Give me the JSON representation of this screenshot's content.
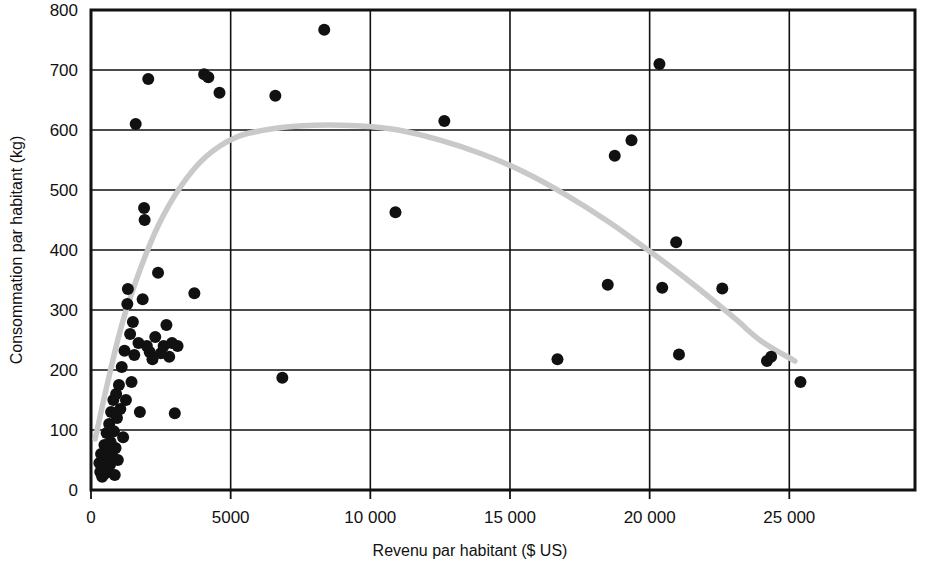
{
  "chart_data": {
    "type": "scatter",
    "title": "",
    "xlabel": "Revenu par habitant ($ US)",
    "ylabel": "Consommation par habitant (kg)",
    "xlim": [
      0,
      29500
    ],
    "ylim": [
      0,
      800
    ],
    "xticks": [
      0,
      5000,
      10000,
      15000,
      20000,
      25000
    ],
    "xtick_labels": [
      "0",
      "5000",
      "10 000",
      "15 000",
      "20 000",
      "25 000"
    ],
    "yticks": [
      0,
      100,
      200,
      300,
      400,
      500,
      600,
      700,
      800
    ],
    "ytick_labels": [
      "0",
      "100",
      "200",
      "300",
      "400",
      "500",
      "600",
      "700",
      "800"
    ],
    "grid": true,
    "grid_axis": "both",
    "legend": false,
    "marker_color": "#111111",
    "marker_size": 12,
    "trendline": {
      "label": "quadratic fit",
      "color": "#c9c9c9",
      "width": 5.5,
      "points": [
        [
          150,
          85
        ],
        [
          600,
          180
        ],
        [
          1100,
          275
        ],
        [
          1700,
          360
        ],
        [
          2400,
          440
        ],
        [
          3200,
          505
        ],
        [
          4100,
          555
        ],
        [
          5200,
          588
        ],
        [
          6500,
          602
        ],
        [
          8000,
          608
        ],
        [
          9500,
          607
        ],
        [
          11000,
          600
        ],
        [
          12500,
          583
        ],
        [
          14000,
          560
        ],
        [
          15500,
          530
        ],
        [
          17000,
          492
        ],
        [
          18500,
          448
        ],
        [
          20000,
          398
        ],
        [
          21500,
          345
        ],
        [
          23000,
          288
        ],
        [
          24000,
          248
        ],
        [
          25200,
          215
        ]
      ]
    },
    "points": [
      [
        300,
        45
      ],
      [
        330,
        30
      ],
      [
        360,
        60
      ],
      [
        400,
        22
      ],
      [
        420,
        38
      ],
      [
        450,
        55
      ],
      [
        480,
        75
      ],
      [
        520,
        28
      ],
      [
        540,
        48
      ],
      [
        560,
        95
      ],
      [
        600,
        35
      ],
      [
        620,
        65
      ],
      [
        650,
        110
      ],
      [
        680,
        42
      ],
      [
        700,
        80
      ],
      [
        720,
        130
      ],
      [
        760,
        58
      ],
      [
        800,
        150
      ],
      [
        820,
        98
      ],
      [
        850,
        25
      ],
      [
        880,
        70
      ],
      [
        900,
        160
      ],
      [
        930,
        120
      ],
      [
        960,
        50
      ],
      [
        1000,
        175
      ],
      [
        1050,
        135
      ],
      [
        1100,
        205
      ],
      [
        1150,
        88
      ],
      [
        1200,
        232
      ],
      [
        1250,
        150
      ],
      [
        1300,
        310
      ],
      [
        1320,
        335
      ],
      [
        1400,
        260
      ],
      [
        1450,
        180
      ],
      [
        1500,
        280
      ],
      [
        1550,
        225
      ],
      [
        1600,
        610
      ],
      [
        1700,
        245
      ],
      [
        1750,
        130
      ],
      [
        1850,
        318
      ],
      [
        1900,
        470
      ],
      [
        1920,
        450
      ],
      [
        2000,
        240
      ],
      [
        2050,
        685
      ],
      [
        2100,
        230
      ],
      [
        2200,
        218
      ],
      [
        2300,
        255
      ],
      [
        2400,
        362
      ],
      [
        2500,
        228
      ],
      [
        2600,
        240
      ],
      [
        2700,
        275
      ],
      [
        2800,
        222
      ],
      [
        2900,
        245
      ],
      [
        3000,
        128
      ],
      [
        3100,
        240
      ],
      [
        3700,
        328
      ],
      [
        4050,
        693
      ],
      [
        4200,
        688
      ],
      [
        4600,
        662
      ],
      [
        6600,
        657
      ],
      [
        6850,
        187
      ],
      [
        8350,
        767
      ],
      [
        10900,
        463
      ],
      [
        12650,
        615
      ],
      [
        16700,
        218
      ],
      [
        18500,
        342
      ],
      [
        18750,
        557
      ],
      [
        19350,
        583
      ],
      [
        20350,
        710
      ],
      [
        20450,
        337
      ],
      [
        20950,
        413
      ],
      [
        21050,
        226
      ],
      [
        22600,
        336
      ],
      [
        24200,
        215
      ],
      [
        24350,
        222
      ],
      [
        25400,
        180
      ]
    ]
  }
}
